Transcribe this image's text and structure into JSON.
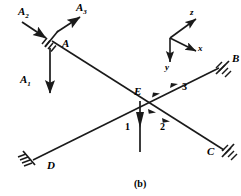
{
  "figure": {
    "caption": "(b)",
    "stroke_color": "#1a1a1a",
    "background_color": "#ffffff",
    "joints": [
      {
        "id": "A",
        "label": "A",
        "x": 62,
        "y": 44,
        "support": true
      },
      {
        "id": "B",
        "label": "B",
        "x": 232,
        "y": 59,
        "support": true
      },
      {
        "id": "C",
        "label": "C",
        "x": 209,
        "y": 152,
        "support": true
      },
      {
        "id": "D",
        "label": "D",
        "x": 48,
        "y": 166,
        "support": true
      },
      {
        "id": "E",
        "label": "E",
        "x": 136,
        "y": 95,
        "support": false
      }
    ],
    "forces": [
      {
        "id": "A1",
        "label": "A",
        "subscript": "1",
        "x": 22,
        "y": 80,
        "direction": "down"
      },
      {
        "id": "A2",
        "label": "A",
        "subscript": "2",
        "x": 22,
        "y": 12,
        "direction": "down-right"
      },
      {
        "id": "A3",
        "label": "A",
        "subscript": "3",
        "x": 78,
        "y": 6,
        "direction": "up-right"
      }
    ],
    "member_labels": [
      {
        "id": "member-1",
        "label": "1",
        "x": 125,
        "y": 124
      },
      {
        "id": "member-2",
        "label": "2",
        "x": 160,
        "y": 124
      },
      {
        "id": "member-3",
        "label": "3",
        "x": 183,
        "y": 84
      }
    ],
    "axes": {
      "origin_label": "",
      "items": [
        {
          "id": "z",
          "label": "z",
          "x": 190,
          "y": 8
        },
        {
          "id": "x",
          "label": "x",
          "x": 198,
          "y": 44
        },
        {
          "id": "y",
          "label": "y",
          "x": 165,
          "y": 65
        }
      ]
    }
  }
}
